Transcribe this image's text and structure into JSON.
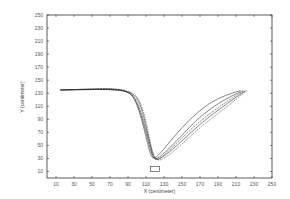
{
  "chart_data": {
    "type": "line",
    "title": "",
    "xlabel": "X (centimeter)",
    "ylabel": "Y (centimeter)",
    "xlim": [
      0,
      250
    ],
    "ylim": [
      0,
      250
    ],
    "xticks": [
      10,
      30,
      50,
      70,
      90,
      110,
      130,
      150,
      170,
      190,
      210,
      230,
      250
    ],
    "yticks": [
      10,
      30,
      50,
      70,
      90,
      110,
      130,
      150,
      170,
      190,
      210,
      230,
      250
    ],
    "grid": false,
    "legend": null,
    "series": [
      {
        "name": "trajectory 1",
        "x": [
          15,
          40,
          70,
          88,
          96,
          102,
          108,
          113,
          117,
          125,
          140,
          160,
          180,
          200,
          215
        ],
        "y": [
          135,
          135.5,
          136,
          134,
          125,
          105,
          75,
          45,
          28,
          36,
          62,
          92,
          115,
          128,
          134
        ]
      },
      {
        "name": "trajectory 2",
        "x": [
          15,
          40,
          70,
          90,
          98,
          104,
          110,
          115,
          119,
          127,
          145,
          165,
          185,
          205,
          218
        ],
        "y": [
          135,
          135.5,
          136,
          133,
          122,
          100,
          70,
          42,
          27,
          34,
          58,
          88,
          110,
          126,
          134
        ]
      },
      {
        "name": "trajectory 3",
        "x": [
          15,
          40,
          72,
          92,
          100,
          106,
          112,
          116,
          120,
          128,
          145,
          168,
          190,
          208,
          220
        ],
        "y": [
          135,
          136,
          137,
          132,
          118,
          95,
          65,
          40,
          26,
          32,
          55,
          85,
          108,
          125,
          134
        ]
      },
      {
        "name": "trajectory 4",
        "x": [
          15,
          40,
          75,
          95,
          103,
          108,
          113,
          117,
          121,
          130,
          148,
          170,
          192,
          210,
          221
        ],
        "y": [
          135,
          136,
          137,
          131,
          116,
          92,
          62,
          38,
          27,
          33,
          54,
          83,
          106,
          124,
          134
        ]
      },
      {
        "name": "trajectory 5",
        "x": [
          15,
          40,
          78,
          98,
          105,
          110,
          114,
          118,
          123,
          132,
          150,
          172,
          195,
          212,
          222
        ],
        "y": [
          135,
          136,
          138,
          130,
          112,
          88,
          58,
          36,
          26,
          31,
          52,
          80,
          104,
          123,
          134
        ]
      }
    ],
    "annotations": [
      {
        "type": "rectangle",
        "x": [
          115,
          125
        ],
        "y": [
          10,
          18
        ],
        "label": ""
      }
    ]
  }
}
